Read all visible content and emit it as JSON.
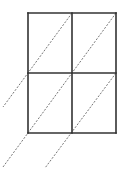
{
  "diagram": {
    "type": "lattice-multiplication-grid",
    "rows": 2,
    "cols": 2,
    "grid": {
      "x": [
        28,
        72,
        116
      ],
      "y": [
        13,
        73,
        133
      ],
      "stroke": "#333333",
      "stroke_width": 1.6
    },
    "diagonals": [
      {
        "x1": 72,
        "y1": 13,
        "x2": 3,
        "y2": 107
      },
      {
        "x1": 116,
        "y1": 13,
        "x2": 3,
        "y2": 167
      },
      {
        "x1": 116,
        "y1": 73,
        "x2": 45,
        "y2": 168
      }
    ],
    "diagonal_style": {
      "stroke": "#666666",
      "stroke_width": 0.9,
      "dash": "2,1.5"
    }
  }
}
